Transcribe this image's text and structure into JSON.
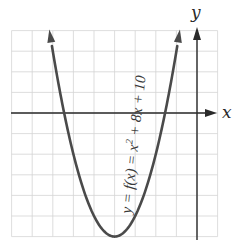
{
  "chart_data": {
    "type": "line",
    "title": "",
    "function": "y = x^2 + 8x + 10",
    "label": "y = f(x) = x² + 8x + 10",
    "xlabel": "x",
    "ylabel": "y",
    "xlim": [
      -9,
      1
    ],
    "ylim": [
      -6,
      4
    ],
    "grid": true,
    "grid_step": 1,
    "tick_labels": false,
    "vertex": {
      "x": -4,
      "y": -6
    },
    "roots": [
      -6.449,
      -1.551
    ],
    "y_intercept": 10,
    "series": [
      {
        "name": "f(x) = x^2 + 8x + 10",
        "x": [
          -7.16,
          -7,
          -6.5,
          -6,
          -5.5,
          -5,
          -4.5,
          -4,
          -3.5,
          -3,
          -2.5,
          -2,
          -1.5,
          -1,
          -0.84
        ],
        "y": [
          4,
          3,
          0.25,
          -2,
          -3.75,
          -5,
          -5.75,
          -6,
          -5.75,
          -5,
          -3.75,
          -2,
          0.25,
          3,
          4
        ]
      }
    ]
  },
  "labels": {
    "x_axis": "x",
    "y_axis": "y",
    "equation_prefix": "y = f(x) = x",
    "equation_exp": "2",
    "equation_suffix": " + 8x + 10"
  },
  "colors": {
    "curve": "#4a4a4a",
    "axis": "#2a2a2a",
    "grid": "#d4d4d4",
    "background": "#ffffff"
  }
}
